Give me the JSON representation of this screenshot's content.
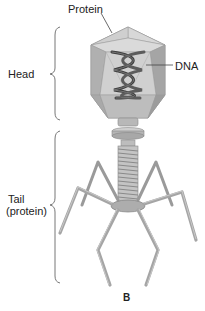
{
  "figure": {
    "panel_label": "B",
    "labels": {
      "protein": "Protein",
      "head": "Head",
      "dna": "DNA",
      "tail_line1": "Tail",
      "tail_line2": "(protein)"
    },
    "colors": {
      "capsid_light": "#d4d4d4",
      "capsid_mid": "#b9b9b9",
      "capsid_dark": "#9e9e9e",
      "dna": "#4a4a4a",
      "tail": "#a8a8a8",
      "bracket": "#555555",
      "text": "#222222"
    }
  }
}
